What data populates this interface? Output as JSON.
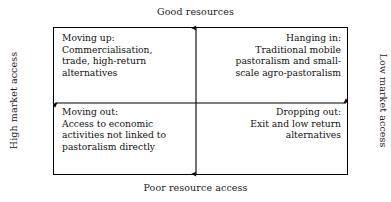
{
  "diagram": {
    "title_top": "Good resources",
    "title_bottom": "Poor resource access",
    "title_left": "High market access",
    "title_right": "Low market access",
    "quadrants": {
      "top_left": {
        "heading": "Moving up:",
        "body": "Commercialisation, trade, high-return alternatives",
        "text": "Moving up:\nCommercialisation,\ntrade, high-return\nalternatives"
      },
      "top_right": {
        "heading": "Hanging in:",
        "body": "Traditional mobile pastoralism and small-scale agro-pastoralism",
        "text": "Hanging in:\nTraditional mobile\npastoralism and small-\nscale agro-pastoralism"
      },
      "bottom_left": {
        "heading": "Moving out:",
        "body": "Access to economic activities not linked to pastoralism directly",
        "text": "Moving out:\nAccess to economic\nactivities not linked to\npastoralism directly"
      },
      "bottom_right": {
        "heading": "Dropping out:",
        "body": "Exit and low return alternatives",
        "text": "Dropping out:\nExit and low return\nalternatives"
      }
    },
    "colors": {
      "background": "#ffffff",
      "line": "#000000",
      "text": "#111111"
    }
  }
}
